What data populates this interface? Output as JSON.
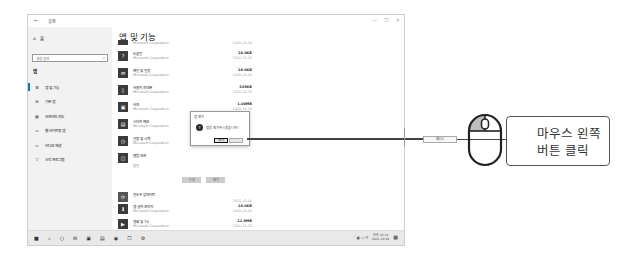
{
  "window": {
    "title": "설정",
    "back_glyph": "←",
    "controls": [
      "—",
      "☐",
      "✕"
    ]
  },
  "sidebar": {
    "home_label": "홈",
    "search_placeholder": "설정 검색",
    "section_label": "앱",
    "items": [
      {
        "label": "앱 및 기능",
        "icon": "apps-list-icon",
        "glyph": "☰",
        "active": true
      },
      {
        "label": "기본 앱",
        "icon": "default-apps-icon",
        "glyph": "⊞"
      },
      {
        "label": "오프라인 지도",
        "icon": "map-icon",
        "glyph": "▦"
      },
      {
        "label": "웹 사이트용 앱",
        "icon": "web-apps-icon",
        "glyph": "▭"
      },
      {
        "label": "비디오 재생",
        "icon": "video-icon",
        "glyph": "▭"
      },
      {
        "label": "시작 프로그램",
        "icon": "startup-icon",
        "glyph": "▽"
      }
    ]
  },
  "main": {
    "page_title": "앱 및 기능",
    "apps_top": [
      {
        "name": "",
        "publisher": "Microsoft Corporation",
        "size": "",
        "date": "2020-11-24"
      },
      {
        "name": "도움말",
        "publisher": "Microsoft Corporation",
        "size": "16.0KB",
        "date": "2020-11-26"
      },
      {
        "name": "메일 및 일정",
        "publisher": "Microsoft Corporation",
        "size": "16.0KB",
        "date": "2020-11-26"
      },
      {
        "name": "사용자 휴대폰",
        "publisher": "Microsoft Corporation",
        "size": "328KB",
        "date": "2020-11-25"
      },
      {
        "name": "사진",
        "publisher": "Microsoft Corporation",
        "size": "1.06MB",
        "date": "2020-11-24"
      },
      {
        "name": "스티커 메모",
        "publisher": "Microsoft Corporation",
        "size": "",
        "date": ""
      },
      {
        "name": "알람 및 시계",
        "publisher": "Microsoft Corporation",
        "size": "",
        "date": ""
      },
      {
        "name": "앨범 보관",
        "publisher": "",
        "size": "",
        "date": ""
      }
    ],
    "selected_app_extra": "옵션",
    "action_buttons": {
      "modify": "수정",
      "uninstall": "제거"
    },
    "apps_bottom": [
      {
        "name": "윈도우 업데이트",
        "publisher": "",
        "size": "",
        "date": "2021-02-06"
      },
      {
        "name": "앱 설치 관리자",
        "publisher": "Microsoft Corporation",
        "size": "16.0KB",
        "date": "2020-11-26"
      },
      {
        "name": "영화 및 TV",
        "publisher": "Microsoft Corporation",
        "size": "11.8MB",
        "date": "2020-11-25"
      },
      {
        "name": "음 악보관 폴더",
        "publisher": "Microsoft Corporation",
        "size": "16.0KB",
        "date": "2020-11-26"
      }
    ]
  },
  "dialog": {
    "title": "앱 제거",
    "message": "앱을 제거하시겠습니까?",
    "yes_label": "예(Y)",
    "no_label": ""
  },
  "taskbar": {
    "icons": [
      "■",
      "⌕",
      "○",
      "⊟",
      "▣",
      "▤",
      "◉",
      "☐",
      "⚙"
    ],
    "tray": "⌃ ▣ ◁ 가",
    "time": "오후 10:14",
    "date": "2021-10-04"
  },
  "annotation": {
    "button_label": "예(Y)",
    "callout_text_line1": "마우스 왼쪽",
    "callout_text_line2": "버튼 클릭"
  }
}
